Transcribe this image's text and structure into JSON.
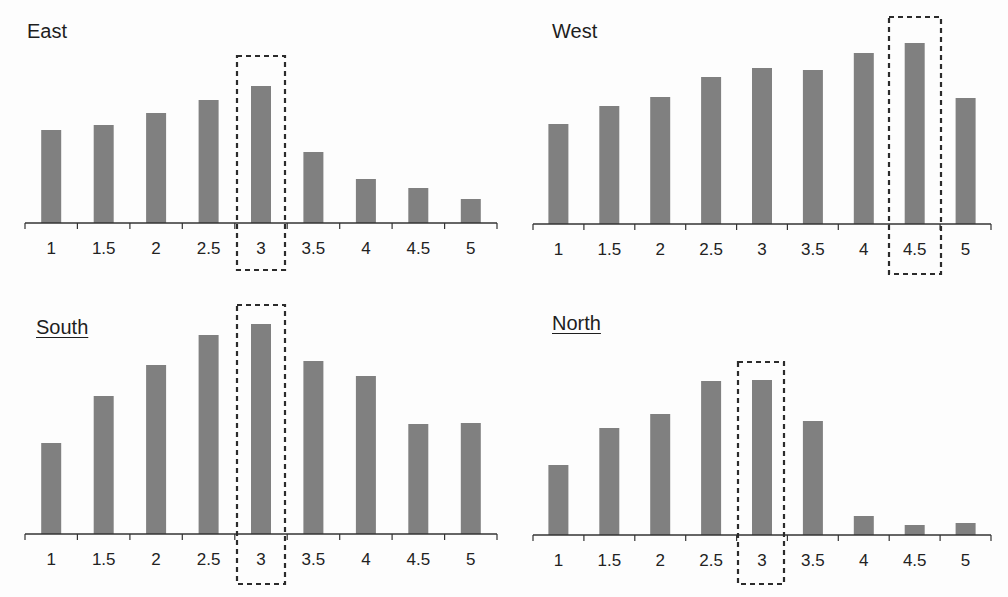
{
  "chart_data": [
    {
      "type": "bar",
      "title": "East",
      "title_underlined": false,
      "categories": [
        "1",
        "1.5",
        "2",
        "2.5",
        "3",
        "3.5",
        "4",
        "4.5",
        "5"
      ],
      "values": [
        93,
        98,
        110,
        123,
        137,
        71,
        44,
        35,
        24
      ],
      "value_scale": "relative bar height (px, no y-axis shown)",
      "highlighted_category": "3",
      "xlabel": "",
      "ylabel": "",
      "grid": false,
      "layout": {
        "left": 25,
        "right": 497,
        "baseline": 223,
        "title_x": 27,
        "title_y": 21,
        "box": [
          237,
          56,
          285,
          270
        ]
      }
    },
    {
      "type": "bar",
      "title": "West",
      "title_underlined": false,
      "categories": [
        "1",
        "1.5",
        "2",
        "2.5",
        "3",
        "3.5",
        "4",
        "4.5",
        "5"
      ],
      "values": [
        100,
        118,
        127,
        147,
        156,
        154,
        171,
        181,
        126
      ],
      "value_scale": "relative bar height (px, no y-axis shown)",
      "highlighted_category": "4.5",
      "xlabel": "",
      "ylabel": "",
      "grid": false,
      "layout": {
        "left": 533,
        "right": 991,
        "baseline": 224,
        "title_x": 552,
        "title_y": 21,
        "box": [
          889,
          17,
          941,
          274
        ]
      }
    },
    {
      "type": "bar",
      "title": "South",
      "title_underlined": true,
      "categories": [
        "1",
        "1.5",
        "2",
        "2.5",
        "3",
        "3.5",
        "4",
        "4.5",
        "5"
      ],
      "values": [
        91,
        138,
        169,
        199,
        210,
        173,
        158,
        110,
        111
      ],
      "value_scale": "relative bar height (px, no y-axis shown)",
      "highlighted_category": "3",
      "xlabel": "",
      "ylabel": "",
      "grid": false,
      "layout": {
        "left": 25,
        "right": 497,
        "baseline": 534,
        "title_x": 36,
        "title_y": 317,
        "box": [
          237,
          305,
          285,
          584
        ]
      }
    },
    {
      "type": "bar",
      "title": "North",
      "title_underlined": true,
      "categories": [
        "1",
        "1.5",
        "2",
        "2.5",
        "3",
        "3.5",
        "4",
        "4.5",
        "5"
      ],
      "values": [
        70,
        107,
        121,
        154,
        155,
        114,
        19,
        10,
        12
      ],
      "value_scale": "relative bar height (px, no y-axis shown)",
      "highlighted_category": "3",
      "xlabel": "",
      "ylabel": "",
      "grid": false,
      "layout": {
        "left": 533,
        "right": 991,
        "baseline": 535,
        "title_x": 552,
        "title_y": 313,
        "box": [
          738,
          362,
          784,
          584
        ]
      }
    }
  ],
  "colors": {
    "bar": "#808080",
    "axis": "#333333",
    "text": "#222222",
    "highlight_box": "#2b2b2b",
    "background": "#fdfdfd"
  }
}
